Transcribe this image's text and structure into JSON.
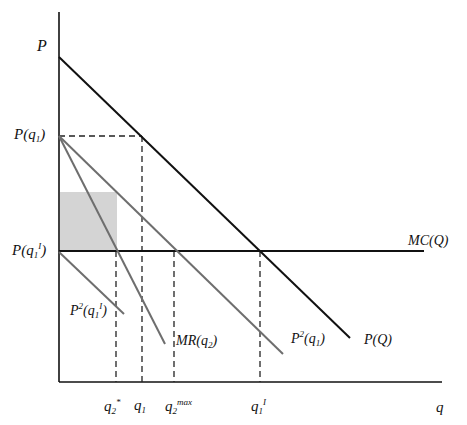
{
  "diagram": {
    "type": "economics-price-quantity",
    "colors": {
      "axis": "#111111",
      "demand": "#111111",
      "mc": "#111111",
      "gray_lines": "#6e6e6e",
      "shaded_area": "#d4d4d4",
      "dashed": "#222222"
    },
    "axes": {
      "y_label": "P",
      "x_label": "q"
    },
    "y_ticks": {
      "p_q1": {
        "base": "P(q",
        "sub": "1",
        "close": ")"
      },
      "p_q1_i": {
        "base": "P(q",
        "sub": "1",
        "sup": "I",
        "close": ")"
      }
    },
    "x_ticks": {
      "q2_star": {
        "base": "q",
        "sub": "2",
        "sup": "*"
      },
      "q1": {
        "base": "q",
        "sub": "1"
      },
      "q2_max": {
        "base": "q",
        "sub": "2",
        "sup": "max"
      },
      "q1_i": {
        "base": "q",
        "sub": "1",
        "sup": "I"
      }
    },
    "curves": {
      "demand": "P(Q)",
      "marginal_cost": "MC(Q)",
      "residual_demand": {
        "base": "P",
        "sup": "2",
        "arg": "(q",
        "sub": "1",
        "close": ")"
      },
      "residual_demand_i": {
        "base": "P",
        "sup": "2",
        "arg": "(q",
        "sub": "1",
        "sup2": "I",
        "close": ")"
      },
      "marginal_revenue": {
        "base": "MR(q",
        "sub": "2",
        "close": ")"
      }
    }
  }
}
